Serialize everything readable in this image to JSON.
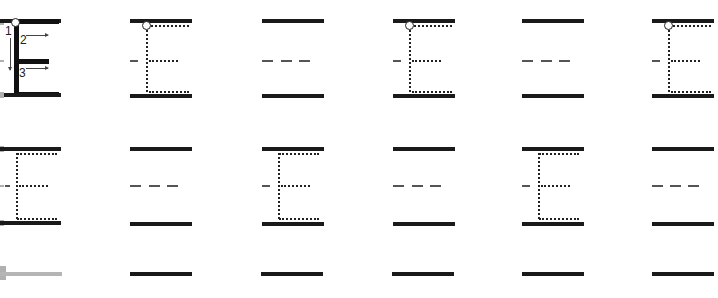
{
  "worksheet": {
    "letter": "E",
    "stroke_numbers": [
      "1",
      "2",
      "3"
    ],
    "colors": {
      "guide_line": "#1a1a1a",
      "mid_dash": "#555555",
      "dotted_trace": "#222222",
      "faded_line": "#b5b5b5"
    },
    "rows": [
      {
        "cells": [
          {
            "type": "model",
            "x": 0
          },
          {
            "type": "trace",
            "x": 130
          },
          {
            "type": "blank",
            "x": 262
          },
          {
            "type": "trace",
            "x": 392
          },
          {
            "type": "blank",
            "x": 522
          },
          {
            "type": "trace",
            "x": 652
          }
        ]
      },
      {
        "cells": [
          {
            "type": "trace-no-start",
            "x": 0
          },
          {
            "type": "blank",
            "x": 130
          },
          {
            "type": "trace-no-start",
            "x": 262
          },
          {
            "type": "blank",
            "x": 392
          },
          {
            "type": "trace-no-start",
            "x": 522
          },
          {
            "type": "blank",
            "x": 652
          }
        ]
      },
      {
        "cells": [
          {
            "type": "line-faded",
            "x": 0
          },
          {
            "type": "line",
            "x": 130
          },
          {
            "type": "line",
            "x": 262
          },
          {
            "type": "line",
            "x": 392
          },
          {
            "type": "line",
            "x": 522
          },
          {
            "type": "line",
            "x": 652
          }
        ]
      }
    ]
  }
}
